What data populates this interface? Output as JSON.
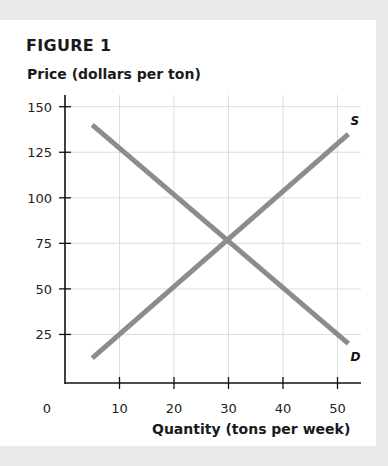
{
  "figure": {
    "title": "FIGURE 1",
    "ylabel": "Price (dollars per ton)",
    "xlabel": "Quantity (tons per week)",
    "line_color": "#8c8c8c",
    "grid_color": "#dddddd"
  },
  "chart_data": {
    "type": "line",
    "title": "FIGURE 1",
    "xlabel": "Quantity (tons per week)",
    "ylabel": "Price (dollars per ton)",
    "xlim": [
      0,
      55
    ],
    "ylim": [
      0,
      155
    ],
    "x_ticks": [
      0,
      10,
      20,
      30,
      40,
      50
    ],
    "y_ticks": [
      25,
      50,
      75,
      100,
      125,
      150
    ],
    "grid": true,
    "legend": "inline labels at line ends",
    "series": [
      {
        "name": "S",
        "label": "S",
        "points": [
          [
            5,
            12
          ],
          [
            52,
            135
          ]
        ]
      },
      {
        "name": "D",
        "label": "D",
        "points": [
          [
            5,
            140
          ],
          [
            52,
            20
          ]
        ]
      }
    ],
    "annotations": [
      {
        "text": "equilibrium intersection",
        "x": 30,
        "y": 75
      }
    ]
  }
}
